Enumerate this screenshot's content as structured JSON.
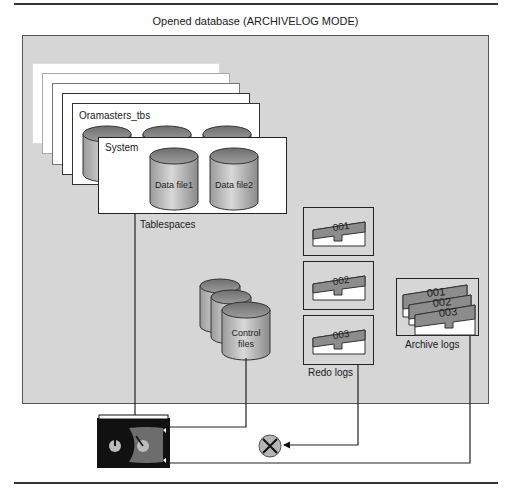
{
  "diagram": {
    "title": "Opened database (ARCHIVELOG MODE)",
    "tablespaces": {
      "label": "Tablespaces",
      "items": [
        {
          "name": "Oramasters_tbs"
        },
        {
          "name": "System",
          "datafiles": [
            "Data file1",
            "Data file2"
          ]
        }
      ]
    },
    "control_files": {
      "label_line1": "Control",
      "label_line2": "files"
    },
    "redo_logs": {
      "label": "Redo logs",
      "groups": [
        "001",
        "002",
        "003"
      ]
    },
    "archive_logs": {
      "label": "Archive logs",
      "files": [
        "001",
        "002",
        "003"
      ]
    },
    "backup_device": {
      "icon": "tape-cartridge-icon"
    },
    "blocked_connection": {
      "icon": "x-circle-icon"
    }
  }
}
